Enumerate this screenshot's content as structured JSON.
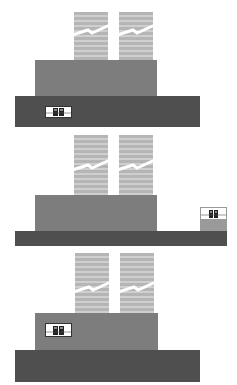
{
  "diagram": {
    "panels": [
      {
        "id": "panel-1",
        "inset_position": "base-left"
      },
      {
        "id": "panel-2",
        "inset_position": "right-stack"
      },
      {
        "id": "panel-3",
        "inset_position": "mid-left"
      }
    ],
    "colors": {
      "tower_light": "#cfcfcf",
      "tower_dark": "#b5b5b5",
      "mid_block": "#7d7d7d",
      "base_block": "#4f4f4f",
      "inset_bg": "#ffffff",
      "background": "#ffffff"
    },
    "icons": {
      "break": "break-line-icon",
      "people": "people-icon"
    }
  }
}
